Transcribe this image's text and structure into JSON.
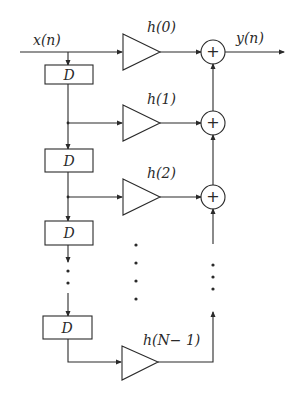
{
  "diagram": {
    "type": "FIR filter direct-form block diagram",
    "input_label": "x(n)",
    "output_label": "y(n)",
    "delay_label": "D",
    "delay_count_shown": 4,
    "taps": [
      {
        "label": "h(0)"
      },
      {
        "label": "h(1)"
      },
      {
        "label": "h(2)"
      },
      {
        "label": "h(N− 1)"
      }
    ],
    "adder_symbol": "+",
    "ellipsis": "⋮",
    "colors": {
      "stroke": "#2a2a2a",
      "background": "#ffffff"
    }
  }
}
